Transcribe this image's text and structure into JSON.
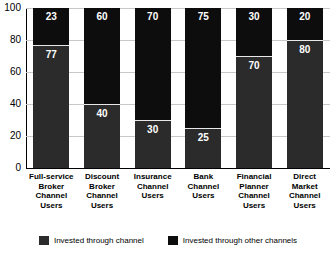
{
  "chart_data": {
    "type": "bar",
    "subtype": "stacked-100-percent",
    "title": "",
    "xlabel": "",
    "ylabel": "",
    "ylim": [
      0,
      100
    ],
    "yticks": [
      0,
      20,
      40,
      60,
      80,
      100
    ],
    "grid": true,
    "legend_position": "bottom",
    "categories": [
      "Full-service Broker Channel Users",
      "Discount Broker Channel Users",
      "Insurance Channel Users",
      "Bank Channel Users",
      "Financial Planner Channel Users",
      "Direct Market Channel Users"
    ],
    "category_label_lines": [
      [
        "Full-service",
        "Broker",
        "Channel",
        "Users"
      ],
      [
        "Discount",
        "Broker",
        "Channel",
        "Users"
      ],
      [
        "Insurance",
        "Channel",
        "Users"
      ],
      [
        "Bank",
        "Channel",
        "Users"
      ],
      [
        "Financial",
        "Planner",
        "Channel",
        "Users"
      ],
      [
        "Direct",
        "Market",
        "Channel",
        "Users"
      ]
    ],
    "series": [
      {
        "name": "Invested through channel",
        "color": "#2b2b2b",
        "values": [
          77,
          40,
          30,
          25,
          70,
          80
        ]
      },
      {
        "name": "Invested through other channels",
        "color": "#0d0d0d",
        "values": [
          23,
          60,
          70,
          75,
          30,
          20
        ]
      }
    ]
  },
  "axis": {
    "y_tick_labels": [
      "100",
      "80",
      "60",
      "40",
      "20",
      "0"
    ]
  },
  "legend": {
    "items": [
      {
        "label": "Invested through channel",
        "swatch": "channel"
      },
      {
        "label": "Invested through other channels",
        "swatch": "other"
      }
    ]
  }
}
